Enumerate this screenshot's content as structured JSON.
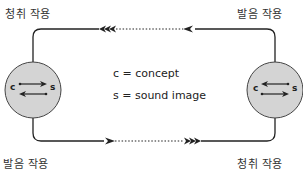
{
  "labels": {
    "top_left": "청취 작용",
    "top_right": "발음 작용",
    "bottom_left": "발음 작용",
    "bottom_right": "청취 작용"
  },
  "legend": {
    "c_line": "c = concept",
    "s_line": "s = sound image"
  },
  "speakers": [
    {
      "id": "left",
      "concept": "c",
      "sound": "s"
    },
    {
      "id": "right",
      "concept": "c",
      "sound": "s"
    }
  ],
  "colors": {
    "circle_fill": "#d4d4d4",
    "line": "#222222"
  }
}
